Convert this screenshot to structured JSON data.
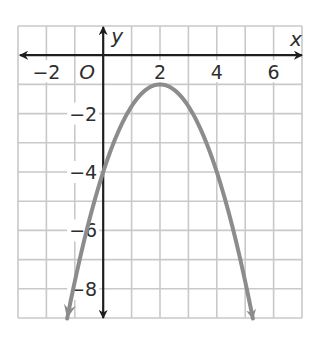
{
  "chart_data": {
    "type": "line",
    "title": "",
    "xlabel": "x",
    "ylabel": "y",
    "origin_label": "O",
    "xlim": [
      -3,
      7
    ],
    "ylim": [
      -9,
      1
    ],
    "grid": true,
    "grid_step": 1,
    "x_ticks": [
      {
        "value": -2,
        "label": "−2"
      },
      {
        "value": 2,
        "label": "2"
      },
      {
        "value": 4,
        "label": "4"
      },
      {
        "value": 6,
        "label": "6"
      }
    ],
    "y_ticks": [
      {
        "value": -2,
        "label": "−2"
      },
      {
        "value": -4,
        "label": "−4"
      },
      {
        "value": -6,
        "label": "−6"
      },
      {
        "value": -8,
        "label": "−8"
      }
    ],
    "series": [
      {
        "name": "parabola",
        "equation": "y = -0.75(x - 2)^2 - 1",
        "vertex": [
          2,
          -1
        ],
        "y_intercept": [
          0,
          -4
        ],
        "x_range": [
          -1.27,
          5.27
        ],
        "arrows_at_ends": true,
        "x": [
          -1.25,
          -1,
          0,
          1,
          2,
          3,
          4,
          5,
          5.25
        ],
        "y": [
          -8.92,
          -7.75,
          -4,
          -1.75,
          -1,
          -1.75,
          -4,
          -7.75,
          -8.92
        ]
      }
    ],
    "legend": null
  },
  "colors": {
    "background": "#ffffff",
    "grid": "#c9c9c9",
    "axis": "#1e1e1e",
    "curve": "#8c8c8c",
    "text": "#2e2e2e"
  }
}
